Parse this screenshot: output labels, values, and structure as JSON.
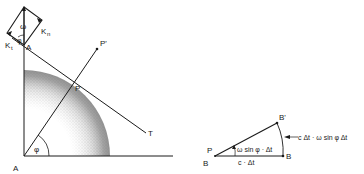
{
  "left_diagram": {
    "labels": {
      "origin": "A",
      "top_point": "A",
      "surface_point": "P",
      "outer_point": "P'",
      "tangent_end": "T",
      "angle": "φ",
      "omega": "ω",
      "k_t": "K",
      "k_t_sub": "t",
      "k_n": "K",
      "k_n_sub": "n",
      "small_angle": "φ"
    }
  },
  "right_diagram": {
    "labels": {
      "apex_top": "P",
      "apex_bottom": "B",
      "end_point": "B",
      "rotated_point": "B'",
      "base_length": "c · Δt",
      "arc_length": "c Δt · ω sin φ Δt",
      "angle_label": "ω sin φ · Δt"
    }
  },
  "colors": {
    "ink": "#1a1a1a",
    "shade": "#555555",
    "background": "#ffffff"
  }
}
